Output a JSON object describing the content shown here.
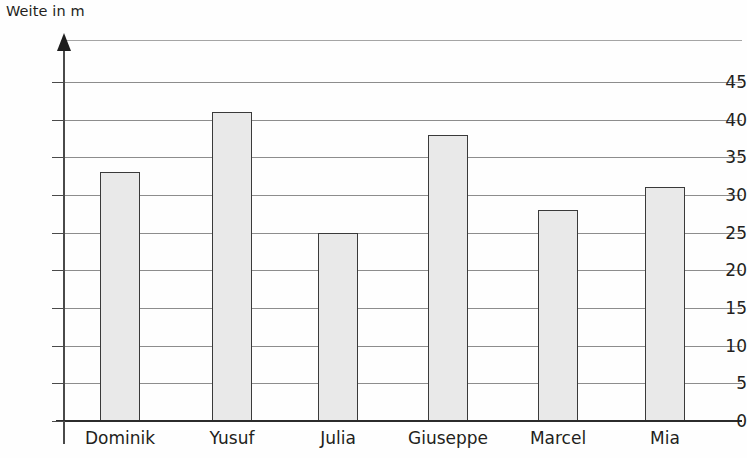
{
  "chart_data": {
    "type": "bar",
    "title": "",
    "xlabel": "",
    "ylabel": "Weite in m",
    "categories": [
      "Dominik",
      "Yusuf",
      "Julia",
      "Giuseppe",
      "Marcel",
      "Mia"
    ],
    "values": [
      33,
      41,
      25,
      38,
      28,
      31
    ],
    "ylim": [
      0,
      47
    ],
    "ytick_labels": [
      "0",
      "5",
      "10",
      "15",
      "20",
      "25",
      "30",
      "35",
      "40",
      "45"
    ],
    "ytick_values": [
      0,
      5,
      10,
      15,
      20,
      25,
      30,
      35,
      40,
      45
    ],
    "ytick_step": 5,
    "grid": true,
    "grid_axis": "y",
    "legend": false,
    "legend_position": "none",
    "bar_fill_color": "#e9e9e9",
    "bar_border_color": "#3a3a3a",
    "axis_color": "#2b2b2b",
    "grid_color": "#8d8d8d",
    "text_color": "#231f20",
    "y_axis_has_arrow": true
  },
  "axes": {
    "y_title": "Weite in m"
  }
}
